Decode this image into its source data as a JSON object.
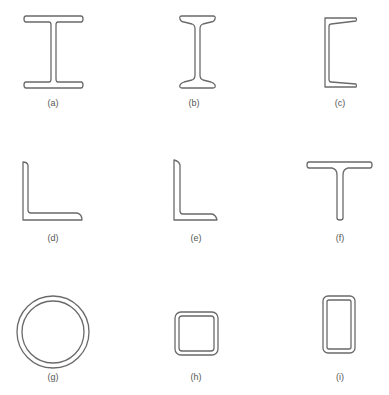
{
  "diagram": {
    "colors": {
      "line": "#6a6a6a",
      "text": "#555555",
      "background": "#ffffff"
    },
    "sections": [
      {
        "id": "a",
        "label": "(a)",
        "shape": "wide-flange-beam"
      },
      {
        "id": "b",
        "label": "(b)",
        "shape": "i-beam-tapered-flange"
      },
      {
        "id": "c",
        "label": "(c)",
        "shape": "channel"
      },
      {
        "id": "d",
        "label": "(d)",
        "shape": "equal-angle"
      },
      {
        "id": "e",
        "label": "(e)",
        "shape": "unequal-angle"
      },
      {
        "id": "f",
        "label": "(f)",
        "shape": "tee"
      },
      {
        "id": "g",
        "label": "(g)",
        "shape": "round-tube"
      },
      {
        "id": "h",
        "label": "(h)",
        "shape": "square-tube"
      },
      {
        "id": "i",
        "label": "(i)",
        "shape": "rectangular-tube"
      }
    ]
  }
}
